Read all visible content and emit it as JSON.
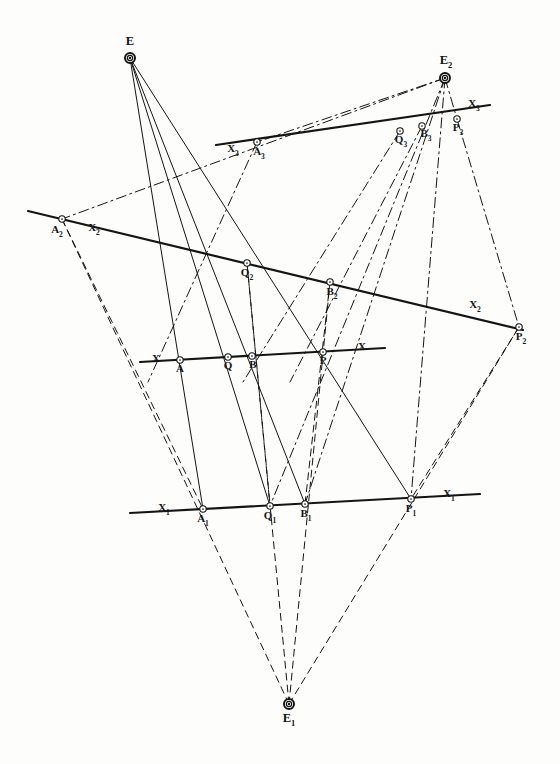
{
  "figure": {
    "background_color": "#fdfdfc",
    "ink_color": "#141414"
  },
  "style": {
    "solid": "solid",
    "dashed": "dashed",
    "dash_dot": "dash-dot",
    "line_width_thin": 1,
    "line_width_axis": 2.2,
    "node_radius": 3.2
  },
  "vertices": [
    {
      "id": "E",
      "label": "E",
      "sub": "",
      "x": 130,
      "y": 58,
      "label_x": 130,
      "label_y": 45,
      "ring": "double"
    },
    {
      "id": "E2",
      "label": "E",
      "sub": "2",
      "x": 445,
      "y": 78,
      "label_x": 446,
      "label_y": 64,
      "ring": "double"
    },
    {
      "id": "E1",
      "label": "E",
      "sub": "1",
      "x": 289,
      "y": 704,
      "label_x": 289,
      "label_y": 722,
      "ring": "double"
    }
  ],
  "axes": [
    {
      "id": "X3",
      "label": "X",
      "sub": "3",
      "x1": 216,
      "y1": 145,
      "x2": 490,
      "y2": 105,
      "label_left_x": 233,
      "label_left_y": 152,
      "label_right_x": 474,
      "label_right_y": 107,
      "style": "solid"
    },
    {
      "id": "X2",
      "label": "X",
      "sub": "2",
      "x1": 28,
      "y1": 211,
      "x2": 523,
      "y2": 330,
      "label_left_x": 94,
      "label_left_y": 231,
      "label_right_x": 475,
      "label_right_y": 308,
      "style": "solid"
    },
    {
      "id": "X",
      "label": "X",
      "sub": "",
      "x1": 140,
      "y1": 362,
      "x2": 385,
      "y2": 348,
      "label_left_x": 156,
      "label_left_y": 362,
      "label_right_x": 362,
      "label_right_y": 350,
      "style": "solid"
    },
    {
      "id": "X1",
      "label": "X",
      "sub": "1",
      "x1": 130,
      "y1": 513,
      "x2": 480,
      "y2": 494,
      "label_left_x": 164,
      "label_left_y": 511,
      "label_right_x": 449,
      "label_right_y": 497,
      "style": "solid"
    }
  ],
  "points": [
    {
      "id": "A3",
      "label": "A",
      "sub": "3",
      "x": 257,
      "y": 142,
      "label_x": 259,
      "label_y": 155,
      "axis": "X3"
    },
    {
      "id": "Q3",
      "label": "Q",
      "sub": "3",
      "x": 400,
      "y": 131,
      "label_x": 401,
      "label_y": 143,
      "axis": "X3"
    },
    {
      "id": "B3",
      "label": "B",
      "sub": "3",
      "x": 422,
      "y": 126,
      "label_x": 426,
      "label_y": 137,
      "axis": "X3"
    },
    {
      "id": "P3",
      "label": "P",
      "sub": "3",
      "x": 457,
      "y": 119,
      "label_x": 458,
      "label_y": 131,
      "axis": "X3"
    },
    {
      "id": "A2",
      "label": "A",
      "sub": "2",
      "x": 62,
      "y": 219,
      "label_x": 57,
      "label_y": 233,
      "axis": "X2"
    },
    {
      "id": "Q2",
      "label": "Q",
      "sub": "2",
      "x": 247,
      "y": 263,
      "label_x": 247,
      "label_y": 276,
      "axis": "X2"
    },
    {
      "id": "B2",
      "label": "B",
      "sub": "2",
      "x": 330,
      "y": 282,
      "label_x": 332,
      "label_y": 295,
      "axis": "X2"
    },
    {
      "id": "P2",
      "label": "P",
      "sub": "2",
      "x": 519,
      "y": 327,
      "label_x": 521,
      "label_y": 340,
      "axis": "X2"
    },
    {
      "id": "A",
      "label": "A",
      "sub": "",
      "x": 180,
      "y": 360,
      "label_x": 180,
      "label_y": 372,
      "axis": "X"
    },
    {
      "id": "Q",
      "label": "Q",
      "sub": "",
      "x": 228,
      "y": 357,
      "label_x": 228,
      "label_y": 369,
      "axis": "X"
    },
    {
      "id": "B",
      "label": "B",
      "sub": "",
      "x": 252,
      "y": 356,
      "label_x": 253,
      "label_y": 368,
      "axis": "X"
    },
    {
      "id": "P",
      "label": "P",
      "sub": "",
      "x": 323,
      "y": 352,
      "label_x": 323,
      "label_y": 364,
      "axis": "X"
    },
    {
      "id": "A1",
      "label": "A",
      "sub": "1",
      "x": 203,
      "y": 509,
      "label_x": 203,
      "label_y": 522,
      "axis": "X1"
    },
    {
      "id": "Q1",
      "label": "Q",
      "sub": "1",
      "x": 270,
      "y": 506,
      "label_x": 270,
      "label_y": 519,
      "axis": "X1"
    },
    {
      "id": "B1",
      "label": "B",
      "sub": "1",
      "x": 305,
      "y": 504,
      "label_x": 306,
      "label_y": 517,
      "axis": "X1"
    },
    {
      "id": "P1",
      "label": "P",
      "sub": "1",
      "x": 411,
      "y": 499,
      "label_x": 411,
      "label_y": 512,
      "axis": "X1"
    }
  ],
  "pencils": [
    {
      "id": "pencil-E",
      "centre": "E",
      "style": "solid",
      "rays": [
        {
          "to": "A1",
          "from_x": 130,
          "from_y": 58,
          "to_x": 203,
          "to_y": 509
        },
        {
          "to": "Q1",
          "from_x": 130,
          "from_y": 58,
          "to_x": 270,
          "to_y": 506
        },
        {
          "to": "B1",
          "from_x": 130,
          "from_y": 58,
          "to_x": 305,
          "to_y": 504
        },
        {
          "to": "P1",
          "from_x": 130,
          "from_y": 58,
          "to_x": 411,
          "to_y": 499
        }
      ]
    },
    {
      "id": "pencil-E1",
      "centre": "E1",
      "style": "dashed",
      "rays": [
        {
          "to": "A2",
          "from_x": 289,
          "from_y": 704,
          "to_x": 62,
          "to_y": 219
        },
        {
          "to": "Q2",
          "from_x": 289,
          "from_y": 704,
          "to_x": 247,
          "to_y": 263
        },
        {
          "to": "B2",
          "from_x": 289,
          "from_y": 704,
          "to_x": 330,
          "to_y": 282
        },
        {
          "to": "P2",
          "from_x": 289,
          "from_y": 704,
          "to_x": 519,
          "to_y": 327
        }
      ]
    },
    {
      "id": "pencil-E2",
      "centre": "E2",
      "style": "dash-dot",
      "rays": [
        {
          "to": "A2",
          "from_x": 445,
          "from_y": 78,
          "to_x": 62,
          "to_y": 219
        },
        {
          "to": "Q1",
          "from_x": 445,
          "from_y": 78,
          "to_x": 270,
          "to_y": 506
        },
        {
          "to": "B1",
          "from_x": 445,
          "from_y": 78,
          "to_x": 305,
          "to_y": 504
        },
        {
          "to": "P1",
          "from_x": 445,
          "from_y": 78,
          "to_x": 411,
          "to_y": 499
        },
        {
          "to": "P3",
          "from_x": 445,
          "from_y": 78,
          "to_x": 457,
          "to_y": 119
        },
        {
          "to": "A3",
          "from_x": 445,
          "from_y": 78,
          "to_x": 257,
          "to_y": 142
        }
      ]
    }
  ],
  "connectors": [
    {
      "id": "A2-A1",
      "from_x": 62,
      "from_y": 219,
      "to_x": 203,
      "to_y": 509,
      "style": "dashed"
    },
    {
      "id": "P3-P2",
      "from_x": 457,
      "from_y": 119,
      "to_x": 519,
      "to_y": 327,
      "style": "dash-dot"
    },
    {
      "id": "P2-P1",
      "from_x": 519,
      "from_y": 327,
      "to_x": 411,
      "to_y": 499,
      "style": "dashed"
    },
    {
      "id": "Q2-Q1",
      "from_x": 247,
      "from_y": 263,
      "to_x": 270,
      "to_y": 506,
      "style": "dashed"
    },
    {
      "id": "B2-B1",
      "from_x": 330,
      "from_y": 282,
      "to_x": 305,
      "to_y": 504,
      "style": "dashed"
    },
    {
      "id": "A3-E1-ray",
      "from_x": 257,
      "from_y": 142,
      "to_x": 148,
      "to_y": 382,
      "style": "dash-dot"
    },
    {
      "id": "Q3-down",
      "from_x": 400,
      "from_y": 131,
      "to_x": 243,
      "to_y": 382,
      "style": "dash-dot"
    },
    {
      "id": "B3-down",
      "from_x": 422,
      "from_y": 126,
      "to_x": 290,
      "to_y": 382,
      "style": "dash-dot"
    }
  ]
}
